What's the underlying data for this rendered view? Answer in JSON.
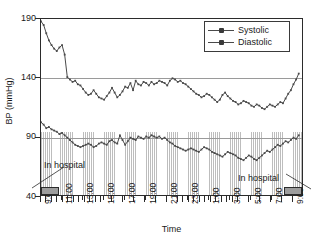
{
  "chart_data": {
    "type": "line",
    "title": "",
    "xlabel": "Time",
    "ylabel": "BP (mmHg)",
    "ylim": [
      40,
      190
    ],
    "y_ticks": [
      190,
      140,
      90,
      40
    ],
    "gridlines": [
      140,
      90
    ],
    "grid": true,
    "legend_position": "top-right",
    "x_tick_labels": [
      "9:00",
      "11:00",
      "13:00",
      "15:00",
      "17:00",
      "19:00",
      "21:00",
      "23:00",
      "1:00",
      "3:00",
      "5:00",
      "7:00",
      "9:00"
    ],
    "x_hours_from_start": [
      0,
      2,
      4,
      6,
      8,
      10,
      12,
      14,
      16,
      18,
      20,
      22,
      24
    ],
    "xlim_hours": [
      0,
      25
    ],
    "series": [
      {
        "name": "Systolic",
        "color": "#4a4a4a",
        "marker": "square",
        "x": [
          0.0,
          0.25,
          0.5,
          0.75,
          1.0,
          1.25,
          1.5,
          1.75,
          2.0,
          2.25,
          2.5,
          2.75,
          3.0,
          3.25,
          3.5,
          3.75,
          4.0,
          4.25,
          4.5,
          4.75,
          5.0,
          5.25,
          5.5,
          5.75,
          6.0,
          6.25,
          6.5,
          6.75,
          7.0,
          7.25,
          7.5,
          7.75,
          8.0,
          8.25,
          8.5,
          8.75,
          9.0,
          9.25,
          9.5,
          9.75,
          10.0,
          10.25,
          10.5,
          10.75,
          11.0,
          11.25,
          11.5,
          11.75,
          12.0,
          12.25,
          12.5,
          12.75,
          13.0,
          13.25,
          13.5,
          13.75,
          14.0,
          14.25,
          14.5,
          14.75,
          15.0,
          15.25,
          15.5,
          15.75,
          16.0,
          16.25,
          16.5,
          16.75,
          17.0,
          17.25,
          17.5,
          17.75,
          18.0,
          18.25,
          18.5,
          18.75,
          19.0,
          19.25,
          19.5,
          19.75,
          20.0,
          20.25,
          20.5,
          20.75,
          21.0,
          21.25,
          21.5,
          21.75,
          22.0,
          22.25,
          22.5,
          22.75,
          23.0,
          23.25,
          23.5,
          23.75,
          24.0,
          24.25,
          24.5
        ],
        "y": [
          188,
          185,
          178,
          172,
          168,
          165,
          163,
          166,
          168,
          160,
          141,
          139,
          137,
          138,
          135,
          134,
          131,
          128,
          126,
          127,
          130,
          127,
          124,
          123,
          122,
          125,
          128,
          132,
          128,
          124,
          126,
          129,
          133,
          132,
          136,
          130,
          138,
          135,
          134,
          137,
          136,
          134,
          137,
          135,
          136,
          138,
          137,
          136,
          134,
          138,
          140,
          139,
          137,
          138,
          136,
          135,
          133,
          131,
          129,
          127,
          126,
          124,
          125,
          127,
          126,
          124,
          122,
          120,
          122,
          126,
          128,
          125,
          123,
          121,
          120,
          118,
          119,
          121,
          120,
          119,
          117,
          116,
          118,
          117,
          115,
          114,
          116,
          118,
          117,
          116,
          118,
          120,
          119,
          123,
          127,
          130,
          135,
          139,
          144
        ]
      },
      {
        "name": "Diastolic",
        "color": "#4a4a4a",
        "marker": "square",
        "x": [
          0.0,
          0.25,
          0.5,
          0.75,
          1.0,
          1.25,
          1.5,
          1.75,
          2.0,
          2.25,
          2.5,
          2.75,
          3.0,
          3.25,
          3.5,
          3.75,
          4.0,
          4.25,
          4.5,
          4.75,
          5.0,
          5.25,
          5.5,
          5.75,
          6.0,
          6.25,
          6.5,
          6.75,
          7.0,
          7.25,
          7.5,
          7.75,
          8.0,
          8.25,
          8.5,
          8.75,
          9.0,
          9.25,
          9.5,
          9.75,
          10.0,
          10.25,
          10.5,
          10.75,
          11.0,
          11.25,
          11.5,
          11.75,
          12.0,
          12.25,
          12.5,
          12.75,
          13.0,
          13.25,
          13.5,
          13.75,
          14.0,
          14.25,
          14.5,
          14.75,
          15.0,
          15.25,
          15.5,
          15.75,
          16.0,
          16.25,
          16.5,
          16.75,
          17.0,
          17.25,
          17.5,
          17.75,
          18.0,
          18.25,
          18.5,
          18.75,
          19.0,
          19.25,
          19.5,
          19.75,
          20.0,
          20.25,
          20.5,
          20.75,
          21.0,
          21.25,
          21.5,
          21.75,
          22.0,
          22.25,
          22.5,
          22.75,
          23.0,
          23.25,
          23.5,
          23.75,
          24.0,
          24.25,
          24.5
        ],
        "y": [
          103,
          101,
          98,
          99,
          97,
          96,
          95,
          93,
          94,
          92,
          90,
          88,
          86,
          84,
          83,
          82,
          83,
          84,
          85,
          84,
          82,
          83,
          85,
          86,
          85,
          84,
          87,
          88,
          86,
          85,
          92,
          88,
          84,
          87,
          90,
          89,
          88,
          91,
          90,
          89,
          91,
          90,
          92,
          91,
          90,
          91,
          89,
          90,
          88,
          86,
          85,
          83,
          82,
          81,
          80,
          79,
          80,
          81,
          80,
          79,
          78,
          80,
          82,
          81,
          80,
          78,
          77,
          76,
          75,
          74,
          76,
          78,
          77,
          76,
          75,
          73,
          72,
          71,
          73,
          75,
          74,
          72,
          71,
          73,
          75,
          77,
          79,
          78,
          80,
          82,
          84,
          83,
          85,
          87,
          86,
          88,
          90,
          89,
          92
        ]
      }
    ]
  },
  "legend": {
    "items": [
      {
        "label": "Systolic"
      },
      {
        "label": "Diastolic"
      }
    ]
  },
  "annotations": [
    {
      "name": "in-hospital-start",
      "label": "In hospital"
    },
    {
      "name": "in-hospital-end",
      "label": "In hospital"
    }
  ],
  "axes": {
    "y_title": "BP (mmHg)",
    "x_title": "Time"
  }
}
